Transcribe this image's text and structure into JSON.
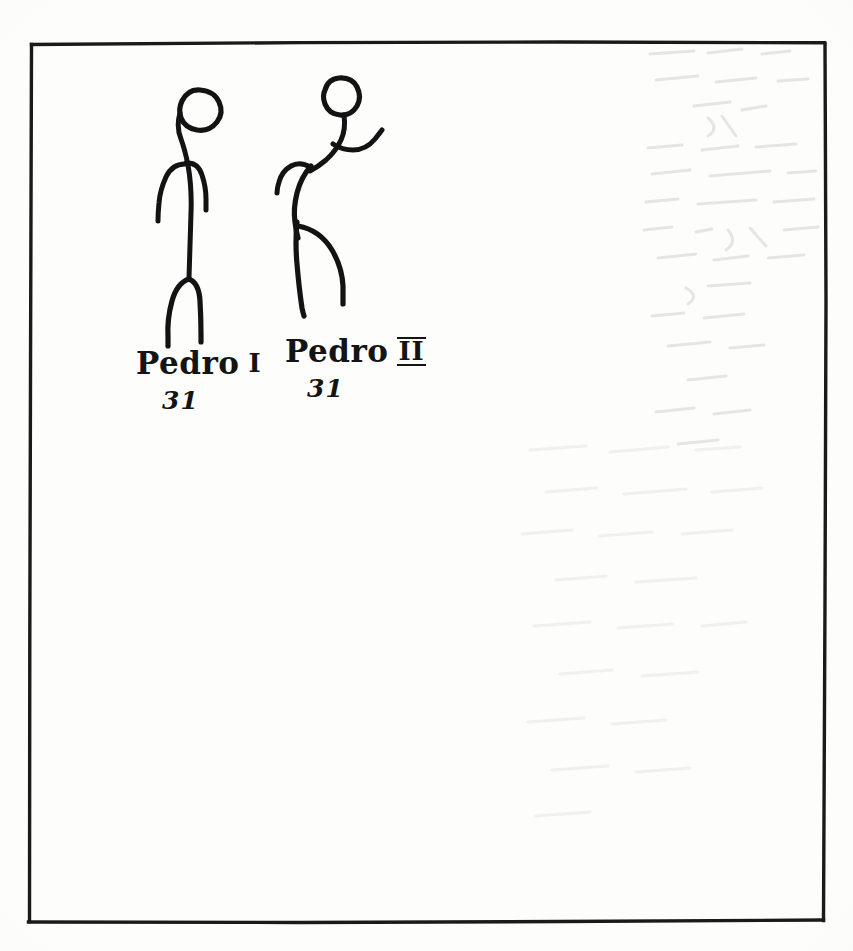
{
  "document": {
    "medium": "hand-drawn ink sketch on paper (scanned)",
    "background_color": "#fdfdfc",
    "ink_color": "#131313"
  },
  "frame": {
    "name": "hand-drawn rectangular border",
    "color": "#1a1a1a"
  },
  "figures": [
    {
      "id": "pedro-i",
      "label": "stick figure standing upright",
      "pose": "standing, head tilted, both arms hanging down, legs apart",
      "caption": {
        "name": "Pedro",
        "numeral": "I",
        "year": "31"
      }
    },
    {
      "id": "pedro-ii",
      "label": "stick figure leaning forward",
      "pose": "leaning forward, one arm raised up-right, one arm bent back, legs striding",
      "caption": {
        "name": "Pedro",
        "numeral": "II",
        "year": "31"
      }
    }
  ]
}
